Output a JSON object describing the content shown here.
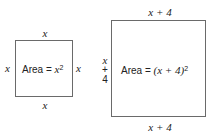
{
  "small_square": {
    "top_label": "x",
    "bottom_label": "x",
    "left_label": "x",
    "right_label": "x",
    "area_prefix": "Area = ",
    "area_expr": "x",
    "area_exp": "2"
  },
  "large_square": {
    "top_label": "x + 4",
    "bottom_label": "x + 4",
    "left_label_lines": [
      "x",
      "+",
      "4"
    ],
    "area_prefix": "Area = ",
    "area_expr": "(x + 4)",
    "area_exp": "2"
  },
  "colors": {
    "stroke": "#6a6a6a",
    "text": "#222222",
    "background": "#ffffff"
  }
}
